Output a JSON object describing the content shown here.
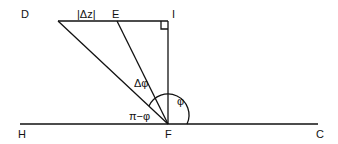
{
  "diagram": {
    "points": {
      "D": "D",
      "E": "E",
      "I": "I",
      "H": "H",
      "F": "F",
      "C": "C"
    },
    "labels": {
      "dz": "|Δz|",
      "dphi": "Δφ",
      "phi": "φ",
      "pi_minus_phi": "π−φ"
    }
  }
}
